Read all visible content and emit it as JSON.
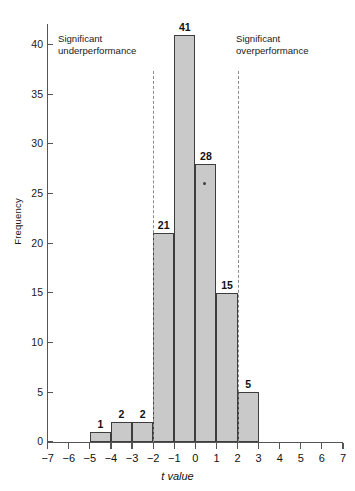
{
  "chart_data": {
    "type": "bar",
    "title": "",
    "xlabel": "t value",
    "ylabel": "Frequency",
    "xlim": [
      -7,
      7
    ],
    "ylim": [
      0,
      42
    ],
    "grid": false,
    "legend": null,
    "bin_width": 1,
    "bins": [
      {
        "left": -5,
        "right": -4,
        "value": 1,
        "label": "1"
      },
      {
        "left": -4,
        "right": -3,
        "value": 2,
        "label": "2"
      },
      {
        "left": -3,
        "right": -2,
        "value": 2,
        "label": "2"
      },
      {
        "left": -2,
        "right": -1,
        "value": 21,
        "label": "21"
      },
      {
        "left": -1,
        "right": 0,
        "value": 41,
        "label": "41"
      },
      {
        "left": 0,
        "right": 1,
        "value": 28,
        "label": "28"
      },
      {
        "left": 1,
        "right": 2,
        "value": 15,
        "label": "15"
      },
      {
        "left": 2,
        "right": 3,
        "value": 5,
        "label": "5"
      }
    ],
    "categories": [
      "-5 to -4",
      "-4 to -3",
      "-3 to -2",
      "-2 to -1",
      "-1 to 0",
      "0 to 1",
      "1 to 2",
      "2 to 3"
    ],
    "values": [
      1,
      2,
      2,
      21,
      41,
      28,
      15,
      5
    ],
    "xticks": [
      "−7",
      "−6",
      "−5",
      "−4",
      "−3",
      "−2",
      "−1",
      "0",
      "1",
      "2",
      "3",
      "4",
      "5",
      "6",
      "7"
    ],
    "xtick_values": [
      -7,
      -6,
      -5,
      -4,
      -3,
      -2,
      -1,
      0,
      1,
      2,
      3,
      4,
      5,
      6,
      7
    ],
    "yticks": [
      "0",
      "5",
      "10",
      "15",
      "20",
      "25",
      "30",
      "35",
      "40"
    ],
    "ytick_values": [
      0,
      5,
      10,
      15,
      20,
      25,
      30,
      35,
      40
    ],
    "reference_lines": [
      {
        "name": "significance-threshold-negative",
        "x": -2,
        "style": "dashed",
        "color": "#8a8a8a"
      },
      {
        "name": "significance-threshold-positive",
        "x": 2,
        "style": "dashed",
        "color": "#8a8a8a"
      }
    ],
    "annotations": [
      {
        "name": "significant-underperformance-note",
        "line1": "Significant",
        "line2": "underperformance"
      },
      {
        "name": "significant-overperformance-note",
        "line1": "Significant",
        "line2": "overperformance"
      }
    ],
    "markers": [
      {
        "name": "single-point-marker",
        "x": 0.45,
        "y": 26
      }
    ],
    "colors": {
      "bar_fill": "#c9c9c9",
      "bar_edge": "#3d3d3d",
      "axis": "#555555",
      "reference_line": "#8a8a8a",
      "text": "#111111"
    }
  }
}
